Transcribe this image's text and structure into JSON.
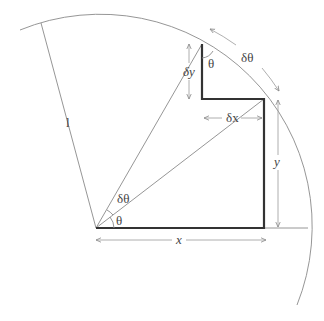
{
  "diagram": {
    "labels": {
      "radius": "l",
      "theta_origin": "θ",
      "dtheta_origin": "δθ",
      "theta_corner": "θ",
      "dtheta_arc": "δθ",
      "dx": "δx",
      "dy": "δy",
      "x": "x",
      "y": "y"
    },
    "colors": {
      "thin_line": "#8a8a8a",
      "thick_line": "#333333",
      "arrow": "#9a9a9a",
      "text": "#444444"
    }
  }
}
